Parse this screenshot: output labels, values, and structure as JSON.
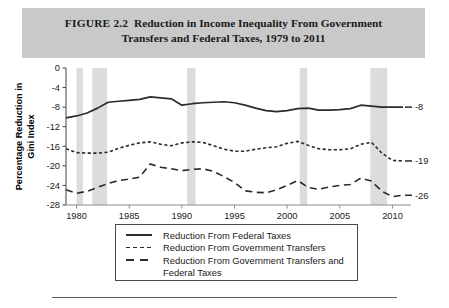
{
  "header": {
    "figure_number": "FIGURE 2.2",
    "title_line1": "Reduction in Income Inequality From Government",
    "title_line2": "Transfers and Federal Taxes, 1979 to 2011",
    "band_color": "#c9c9c9"
  },
  "chart_data": {
    "type": "line",
    "title": "Reduction in Income Inequality From Government Transfers and Federal Taxes, 1979 to 2011",
    "xlabel": "",
    "ylabel": "Percentage Reduction in Gini Index",
    "xlim": [
      1979,
      2011
    ],
    "ylim": [
      -28,
      0
    ],
    "grid": false,
    "legend_position": "below-center",
    "x_ticks": [
      "1980",
      "1985",
      "1990",
      "1995",
      "2000",
      "2005",
      "2010"
    ],
    "x_tick_values": [
      1980,
      1985,
      1990,
      1995,
      2000,
      2005,
      2010
    ],
    "y_ticks": [
      "0",
      "-4",
      "-8",
      "-12",
      "-16",
      "-20",
      "-24",
      "-28"
    ],
    "y_tick_values": [
      0,
      -4,
      -8,
      -12,
      -16,
      -20,
      -24,
      -28
    ],
    "x": [
      1979,
      1980,
      1981,
      1982,
      1983,
      1984,
      1985,
      1986,
      1987,
      1988,
      1989,
      1990,
      1991,
      1992,
      1993,
      1994,
      1995,
      1996,
      1997,
      1998,
      1999,
      2000,
      2001,
      2002,
      2003,
      2004,
      2005,
      2006,
      2007,
      2008,
      2009,
      2010,
      2011
    ],
    "series": [
      {
        "name": "Reduction From Federal Taxes",
        "style": "solid",
        "color": "#2b2b2b",
        "end_label": "-8",
        "values": [
          -10.2,
          -9.8,
          -9.2,
          -8.2,
          -7.0,
          -6.8,
          -6.6,
          -6.4,
          -5.9,
          -6.1,
          -6.3,
          -7.6,
          -7.3,
          -7.1,
          -7.0,
          -6.9,
          -7.1,
          -7.6,
          -8.2,
          -8.7,
          -8.9,
          -8.7,
          -8.3,
          -8.2,
          -8.6,
          -8.6,
          -8.5,
          -8.3,
          -7.6,
          -7.8,
          -8.0,
          -8.0,
          -8.0
        ]
      },
      {
        "name": "Reduction From Government Transfers",
        "style": "dotted",
        "color": "#2b2b2b",
        "end_label": "-19",
        "values": [
          -16.5,
          -17.3,
          -17.4,
          -17.4,
          -17.2,
          -16.4,
          -15.8,
          -15.3,
          -15.1,
          -15.6,
          -15.9,
          -15.3,
          -15.1,
          -15.2,
          -15.9,
          -16.6,
          -17.0,
          -17.0,
          -16.6,
          -16.3,
          -16.1,
          -15.4,
          -15.0,
          -15.8,
          -16.5,
          -16.7,
          -16.7,
          -16.5,
          -15.6,
          -15.2,
          -17.4,
          -18.9,
          -19.0
        ]
      },
      {
        "name": "Reduction From Government Transfers and Federal Taxes",
        "style": "dashed",
        "color": "#2b2b2b",
        "end_label": "-26",
        "values": [
          -24.9,
          -25.6,
          -25.2,
          -24.4,
          -23.6,
          -23.0,
          -22.7,
          -22.3,
          -19.6,
          -20.3,
          -20.6,
          -21.0,
          -20.7,
          -20.6,
          -21.1,
          -22.2,
          -23.4,
          -25.1,
          -25.4,
          -25.5,
          -24.9,
          -24.0,
          -23.0,
          -24.4,
          -24.8,
          -24.3,
          -24.0,
          -23.8,
          -22.5,
          -23.1,
          -25.2,
          -26.3,
          -26.0
        ]
      }
    ],
    "recession_bands": [
      {
        "start": 1980.0,
        "end": 1980.6
      },
      {
        "start": 1981.5,
        "end": 1982.9
      },
      {
        "start": 1990.5,
        "end": 1991.3
      },
      {
        "start": 2001.2,
        "end": 2001.9
      },
      {
        "start": 2007.9,
        "end": 2009.5
      }
    ],
    "recession_band_color": "#dcdcdc"
  },
  "legend": {
    "items": [
      {
        "label": "Reduction From Federal Taxes",
        "style": "solid"
      },
      {
        "label": "Reduction From Government Transfers",
        "style": "dotted"
      },
      {
        "label": "Reduction From Government Transfers and",
        "style": "dashed"
      }
    ],
    "continuation": "Federal Taxes"
  },
  "y_axis_label": {
    "line1": "Percentage Reduction in",
    "line2": "Gini Index"
  }
}
